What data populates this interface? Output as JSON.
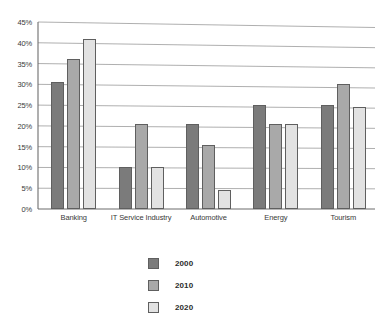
{
  "chart_data": {
    "type": "bar",
    "title": "",
    "xlabel": "",
    "ylabel": "",
    "ylim": [
      0,
      45
    ],
    "grid": true,
    "legend_position": "bottom-center",
    "y_ticks": [
      "0%",
      "5%",
      "10%",
      "15%",
      "20%",
      "25%",
      "30%",
      "35%",
      "40%",
      "45%"
    ],
    "y_tick_values": [
      0,
      5,
      10,
      15,
      20,
      25,
      30,
      35,
      40,
      45
    ],
    "categories": [
      "Banking",
      "IT Service Industry",
      "Automotive",
      "Energy",
      "Tourism"
    ],
    "series": [
      {
        "name": "2000",
        "color": "#7b7b7b",
        "values": [
          30.5,
          10.0,
          20.5,
          25.0,
          25.0
        ]
      },
      {
        "name": "2010",
        "color": "#a9a9a9",
        "values": [
          36.0,
          20.5,
          15.5,
          20.5,
          30.0
        ]
      },
      {
        "name": "2020",
        "color": "#e2e2e2",
        "values": [
          41.0,
          10.0,
          4.5,
          20.5,
          24.5
        ]
      }
    ]
  },
  "legend": {
    "entries": [
      {
        "label": "2000"
      },
      {
        "label": "2010"
      },
      {
        "label": "2020"
      }
    ]
  },
  "colors": {
    "series_2000": "#7b7b7b",
    "series_2010": "#a9a9a9",
    "series_2020": "#e2e2e2",
    "gridline": "#9a9a9a",
    "axis": "#6d6d6d",
    "text": "#2b2b2b",
    "background": "#ffffff"
  }
}
